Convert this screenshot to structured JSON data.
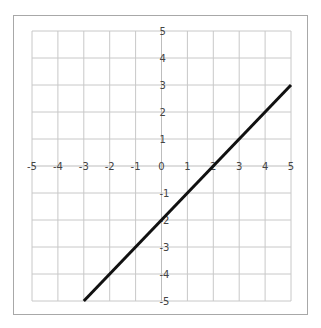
{
  "chart_data": {
    "type": "line",
    "title": "",
    "xlabel": "",
    "ylabel": "",
    "xlim": [
      -5,
      5
    ],
    "ylim": [
      -5,
      5
    ],
    "grid": true,
    "legend": null,
    "x_ticks": [
      "-5",
      "-4",
      "-3",
      "-2",
      "-1",
      "0",
      "1",
      "2",
      "3",
      "4",
      "5"
    ],
    "y_ticks": [
      "5",
      "4",
      "3",
      "2",
      "1",
      "-1",
      "-2",
      "-3",
      "-4",
      "-5"
    ],
    "series": [
      {
        "name": "y = x - 2",
        "x": [
          -3,
          5
        ],
        "y": [
          -5,
          3
        ],
        "color": "#111111"
      }
    ]
  },
  "colors": {
    "grid": "#c8c8c8",
    "axis": "#bdbdbd",
    "line": "#111111",
    "frame": "#a8a8a8",
    "tick_text": "#444444"
  }
}
